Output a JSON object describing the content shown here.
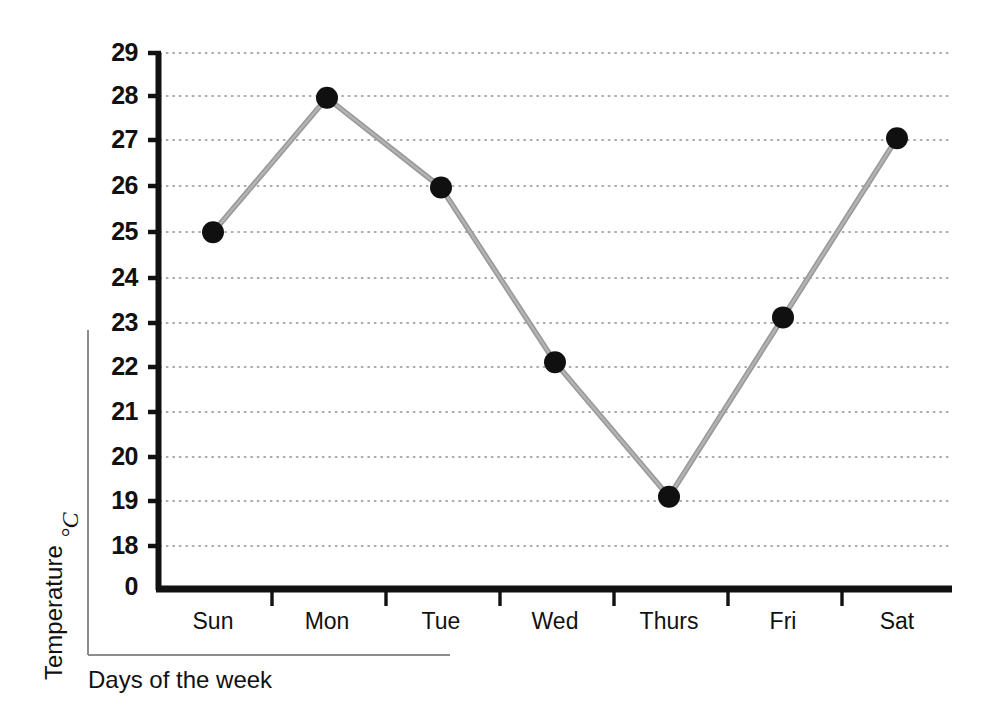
{
  "chart_data": {
    "type": "line",
    "title": "",
    "xlabel": "Days of the week",
    "ylabel": "Temperature",
    "yunit": "°C",
    "categories": [
      "Sun",
      "Mon",
      "Tue",
      "Wed",
      "Thurs",
      "Fri",
      "Sat"
    ],
    "values": [
      25,
      28,
      26,
      22.1,
      19.1,
      23.1,
      27.1
    ],
    "series": [
      {
        "name": "Temperature",
        "values": [
          25,
          28,
          26,
          22.1,
          19.1,
          23.1,
          27.1
        ]
      }
    ],
    "ytick_labels": [
      "0",
      "18",
      "19",
      "20",
      "21",
      "22",
      "23",
      "24",
      "25",
      "26",
      "27",
      "28",
      "29"
    ],
    "ylim": [
      18,
      29
    ],
    "y_axis_break": true,
    "y_origin_label": "0",
    "grid": true,
    "grid_style": "dotted-horizontal",
    "legend": "none",
    "marker": "filled-circle",
    "line_color": "#8c8c8c",
    "marker_color": "#101010",
    "axis_color": "#111111",
    "grid_color": "#9a9a9a",
    "background": "#ffffff"
  },
  "axes": {
    "y_title": "Temperature",
    "y_unit": "°C",
    "x_title": "Days of the week"
  },
  "ticks": {
    "y": [
      {
        "label": "29",
        "value": 29
      },
      {
        "label": "28",
        "value": 28
      },
      {
        "label": "27",
        "value": 27
      },
      {
        "label": "26",
        "value": 26
      },
      {
        "label": "25",
        "value": 25
      },
      {
        "label": "24",
        "value": 24
      },
      {
        "label": "23",
        "value": 23
      },
      {
        "label": "22",
        "value": 22
      },
      {
        "label": "21",
        "value": 21
      },
      {
        "label": "20",
        "value": 20
      },
      {
        "label": "19",
        "value": 19
      },
      {
        "label": "18",
        "value": 18
      },
      {
        "label": "0",
        "value": 0
      }
    ],
    "x": [
      {
        "label": "Sun"
      },
      {
        "label": "Mon"
      },
      {
        "label": "Tue"
      },
      {
        "label": "Wed"
      },
      {
        "label": "Thurs"
      },
      {
        "label": "Fri"
      },
      {
        "label": "Sat"
      }
    ]
  }
}
